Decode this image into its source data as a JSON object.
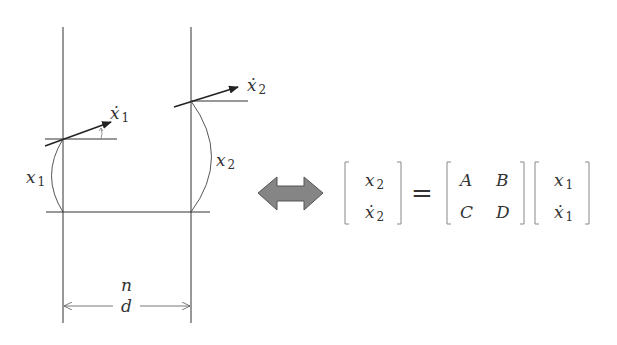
{
  "diagram": {
    "type": "ray-transfer-matrix",
    "left_panel": {
      "labels": {
        "x1": {
          "base": "x",
          "sub": "1"
        },
        "x1_dot": {
          "base": "ẋ",
          "sub": "1"
        },
        "x2": {
          "base": "x",
          "sub": "2"
        },
        "x2_dot": {
          "base": "ẋ",
          "sub": "2"
        },
        "n": "n",
        "d": "d"
      }
    },
    "equivalence_icon": "double-headed-arrow-icon",
    "equation": {
      "lhs": [
        {
          "base": "x",
          "sub": "2",
          "dot": false
        },
        {
          "base": "x",
          "sub": "2",
          "dot": true
        }
      ],
      "equals": "=",
      "matrix": [
        [
          "A",
          "B"
        ],
        [
          "C",
          "D"
        ]
      ],
      "rhs": [
        {
          "base": "x",
          "sub": "1",
          "dot": false
        },
        {
          "base": "x",
          "sub": "1",
          "dot": true
        }
      ]
    },
    "colors": {
      "line": "#333333",
      "arrow_fill": "#858585",
      "arrow_stroke": "#555555"
    }
  }
}
